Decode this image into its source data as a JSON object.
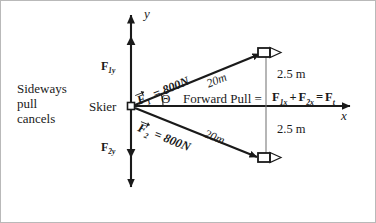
{
  "diagram": {
    "axes": {
      "y_label": "y",
      "x_label": "x"
    },
    "origin_label": "Skier",
    "left_note": {
      "line1": "Sideways",
      "line2": "pull",
      "line3": "cancels"
    },
    "components": {
      "f1y": "F",
      "f1y_sub": "1y",
      "f2y": "F",
      "f2y_sub": "2y"
    },
    "vectors": [
      {
        "name": "F",
        "sub": "1",
        "magnitude": "= 800N",
        "length_label": "20m",
        "target": "boat-upper"
      },
      {
        "name": "F",
        "sub": "2",
        "magnitude": "= 800N",
        "length_label": "20m",
        "target": "boat-lower"
      }
    ],
    "angle_symbol": "Θ",
    "forward_pull_label": "Forward Pull =",
    "equation": {
      "t1": "F",
      "t1_sub": "1x",
      "plus": "+",
      "t2": "F",
      "t2_sub": "2x",
      "equals": "=",
      "t3": "F",
      "t3_sub": "t"
    },
    "distances": {
      "upper": "2.5 m",
      "lower": "2.5 m"
    },
    "colors": {
      "ink": "#1a1a1a",
      "thin_rule": "#7a7a7a",
      "background": "#ffffff",
      "border": "#b9b9b9"
    }
  }
}
